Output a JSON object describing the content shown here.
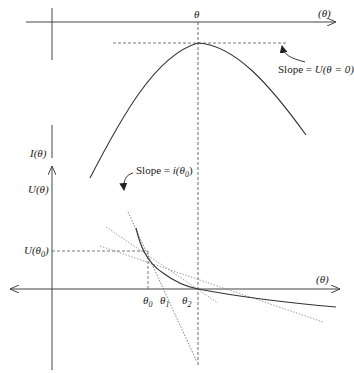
{
  "diagram": {
    "top_panel": {
      "x_axis_label": "(θ)",
      "peak_label": "θ",
      "y_axis_label": "I(θ)",
      "annotation": {
        "prefix": "Slope = ",
        "expr": "U(θ = 0)"
      }
    },
    "bottom_panel": {
      "y_axis_label": "U(θ)",
      "u0_label": "U(θ",
      "u0_sub": "0",
      "u0_close": ")",
      "x_axis_label": "(θ)",
      "annotation": {
        "prefix": "Slope = ",
        "expr": "i(θ",
        "sub": "0",
        "close": ")"
      },
      "ticks": [
        {
          "label": "θ",
          "sub": "0"
        },
        {
          "label": "θ",
          "sub": "1"
        },
        {
          "label": "θ",
          "sub": "2"
        }
      ]
    },
    "colors": {
      "axis": "#444444",
      "curve": "#333333",
      "dashed": "#555555",
      "tangent": "#666666"
    }
  }
}
